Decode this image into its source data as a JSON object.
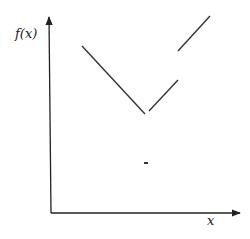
{
  "chart_data": {
    "type": "line",
    "title": "",
    "xlabel": "x",
    "ylabel": "f(x)",
    "grid": false,
    "legend": null,
    "axes": {
      "origin_px": [
        51,
        213
      ],
      "x_axis_end_px": [
        240,
        213
      ],
      "y_axis_end_px": [
        49,
        16
      ]
    },
    "segments": [
      {
        "name": "left-decreasing-segment",
        "from_px": [
          82,
          46
        ],
        "to_px": [
          145,
          114
        ]
      },
      {
        "name": "middle-increasing-segment",
        "from_px": [
          149,
          111
        ],
        "to_px": [
          178,
          80
        ]
      },
      {
        "name": "right-increasing-segment",
        "from_px": [
          178,
          51
        ],
        "to_px": [
          210,
          16
        ]
      }
    ],
    "isolated_points": [
      {
        "name": "isolated-point",
        "at_px": [
          146,
          163
        ]
      }
    ],
    "colors": {
      "line": "#333333",
      "axis": "#222222"
    }
  },
  "labels": {
    "y_axis": "f(x)",
    "x_axis": "x"
  }
}
